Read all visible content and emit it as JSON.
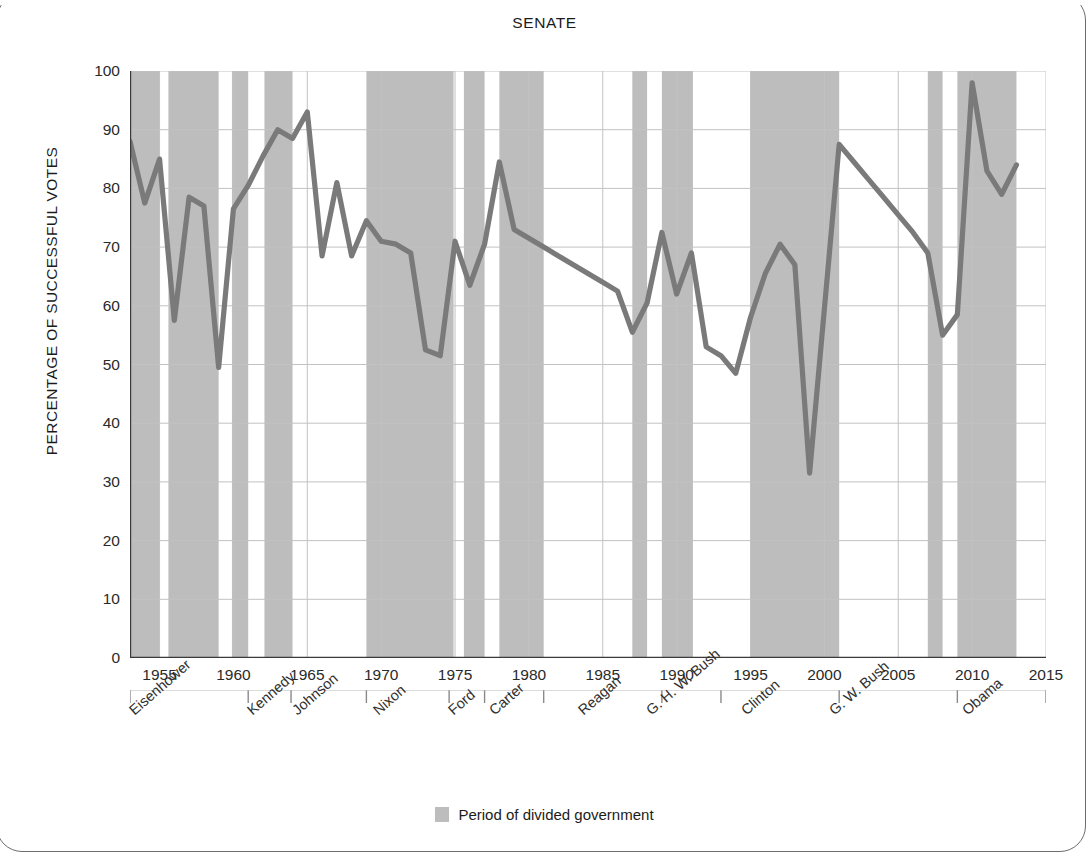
{
  "chart_title": "SENATE",
  "axes": {
    "y_title": "PERCENTAGE OF SUCCESSFUL VOTES",
    "y_ticks": [
      0,
      10,
      20,
      30,
      40,
      50,
      60,
      70,
      80,
      90,
      100
    ],
    "x_ticks": [
      1955,
      1960,
      1965,
      1970,
      1975,
      1980,
      1985,
      1990,
      1995,
      2000,
      2005,
      2010,
      2015
    ]
  },
  "legend": {
    "swatch_color": "#bdbdbd",
    "label": "Period of divided government"
  },
  "presidents": [
    {
      "name": "Eisenhower",
      "x_year": 1953.0
    },
    {
      "name": "Kennedy",
      "x_year": 1961.0
    },
    {
      "name": "Johnson",
      "x_year": 1964.0
    },
    {
      "name": "Nixon",
      "x_year": 1969.5
    },
    {
      "name": "Ford",
      "x_year": 1974.6
    },
    {
      "name": "Carter",
      "x_year": 1977.4
    },
    {
      "name": "Reagan",
      "x_year": 1983.4
    },
    {
      "name": "G. H. W. Bush",
      "x_year": 1988.0
    },
    {
      "name": "Clinton",
      "x_year": 1994.4
    },
    {
      "name": "G. W. Bush",
      "x_year": 2000.4
    },
    {
      "name": "Obama",
      "x_year": 2009.4
    }
  ],
  "chart_data": {
    "type": "line",
    "title": "SENATE",
    "xlabel": "",
    "ylabel": "PERCENTAGE OF SUCCESSFUL VOTES",
    "xlim": [
      1953,
      2015
    ],
    "ylim": [
      0,
      100
    ],
    "grid": true,
    "legend_position": "bottom-center",
    "line_color": "#7a7a7a",
    "band_color": "#bdbdbd",
    "x": [
      1953,
      1954,
      1955,
      1956,
      1957,
      1958,
      1959,
      1960,
      1961,
      1962,
      1963,
      1964,
      1965,
      1966,
      1967,
      1968,
      1969,
      1970,
      1971,
      1972,
      1973,
      1974,
      1975,
      1976,
      1977,
      1978,
      1979,
      1980,
      1981,
      1982,
      1983,
      1984,
      1985,
      1986,
      1987,
      1988,
      1989,
      1990,
      1991,
      1992,
      1993,
      1994,
      1995,
      1996,
      1997,
      1998,
      1999,
      2000,
      2001,
      2002,
      2003,
      2004,
      2005,
      2006,
      2007,
      2008,
      2009,
      2010,
      2011,
      2012,
      2013
    ],
    "y": [
      88.0,
      77.5,
      85.0,
      57.5,
      78.5,
      77.0,
      49.5,
      76.5,
      80.5,
      85.5,
      90.0,
      88.5,
      93.0,
      68.5,
      81.0,
      68.5,
      74.5,
      71.0,
      70.5,
      69.0,
      52.5,
      51.5,
      71.0,
      63.5,
      70.5,
      84.5,
      73.0,
      71.5,
      70.0,
      68.5,
      67.0,
      65.5,
      64.0,
      62.5,
      55.5,
      60.5,
      72.5,
      62.0,
      69.0,
      53.0,
      51.5,
      48.5,
      58.0,
      65.5,
      70.5,
      67.0,
      31.5,
      59.5,
      87.5,
      84.5,
      81.5,
      78.5,
      75.5,
      72.5,
      69.0,
      55.0,
      58.5,
      98.0,
      83.0,
      79.0,
      84.0
    ],
    "series": [
      {
        "name": "Percentage of successful votes",
        "values": [
          88.0,
          77.5,
          85.0,
          57.5,
          78.5,
          77.0,
          49.5,
          76.5,
          80.5,
          85.5,
          90.0,
          88.5,
          93.0,
          68.5,
          81.0,
          68.5,
          74.5,
          71.0,
          70.5,
          69.0,
          52.5,
          51.5,
          71.0,
          63.5,
          70.5,
          84.5,
          73.0,
          71.5,
          70.0,
          68.5,
          67.0,
          65.5,
          64.0,
          62.5,
          55.5,
          60.5,
          72.5,
          62.0,
          69.0,
          53.0,
          51.5,
          48.5,
          58.0,
          65.5,
          70.5,
          67.0,
          31.5,
          59.5,
          87.5,
          84.5,
          81.5,
          78.5,
          75.5,
          72.5,
          69.0,
          55.0,
          58.5,
          98.0,
          83.0,
          79.0,
          84.0
        ]
      }
    ],
    "shaded_bands": [
      {
        "label": "Period of divided government",
        "start": 1953.0,
        "end": 1955.0
      },
      {
        "label": "Period of divided government",
        "start": 1955.6,
        "end": 1959.0
      },
      {
        "label": "Period of divided government",
        "start": 1959.9,
        "end": 1961.0
      },
      {
        "label": "Period of divided government",
        "start": 1962.1,
        "end": 1964.0
      },
      {
        "label": "Period of divided government",
        "start": 1969.0,
        "end": 1974.9
      },
      {
        "label": "Period of divided government",
        "start": 1975.6,
        "end": 1977.0
      },
      {
        "label": "Period of divided government",
        "start": 1978.0,
        "end": 1981.0
      },
      {
        "label": "Period of divided government",
        "start": 1987.0,
        "end": 1988.0
      },
      {
        "label": "Period of divided government",
        "start": 1989.0,
        "end": 1991.1
      },
      {
        "label": "Period of divided government",
        "start": 1995.0,
        "end": 2001.0
      },
      {
        "label": "Period of divided government",
        "start": 2007.0,
        "end": 2008.0
      },
      {
        "label": "Period of divided government",
        "start": 2009.0,
        "end": 2013.0
      }
    ]
  }
}
